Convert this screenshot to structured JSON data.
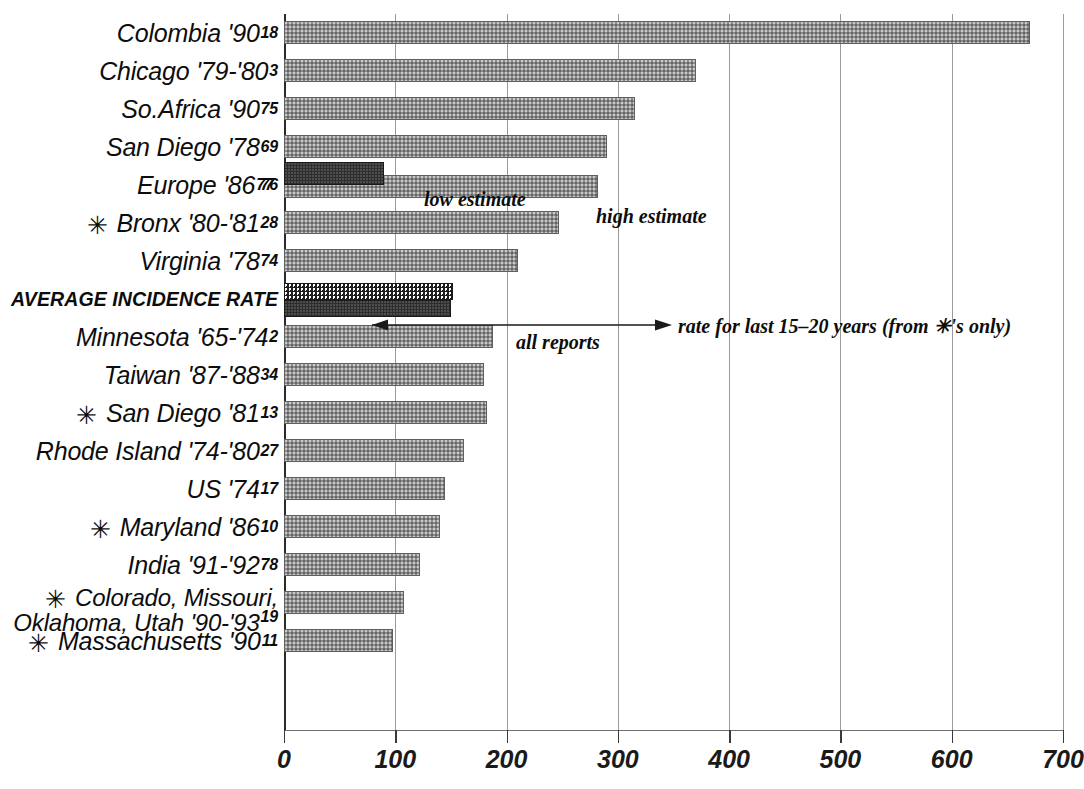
{
  "chart_data": {
    "type": "bar",
    "orientation": "horizontal",
    "title": "",
    "xlabel": "",
    "ylabel": "",
    "xlim": [
      0,
      700
    ],
    "xticks": [
      0,
      100,
      200,
      300,
      400,
      500,
      600,
      700
    ],
    "grid": true,
    "legend_position": "inline-annotations",
    "categories": [
      "Colombia '90",
      "Chicago '79-'80",
      "So.Africa '90",
      "San Diego '78",
      "Europe '86",
      "Bronx '80-'81",
      "Virginia '78",
      "AVERAGE INCIDENCE RATE",
      "Minnesota '65-'74",
      "Taiwan '87-'88",
      "San Diego '81",
      "Rhode Island '74-'80",
      "US '74",
      "Maryland '86",
      "India '91-'92",
      "Colorado, Missouri, Oklahoma, Utah '90-'93",
      "Massachusetts '90"
    ],
    "values": [
      670,
      370,
      315,
      290,
      282,
      247,
      210,
      152,
      188,
      180,
      182,
      162,
      145,
      140,
      122,
      108,
      98
    ],
    "secondary_values": [
      null,
      null,
      null,
      null,
      90,
      null,
      null,
      150,
      null,
      null,
      null,
      null,
      null,
      null,
      null,
      null,
      null
    ],
    "rows": [
      {
        "label": "Colombia '90",
        "refs_sup": "18",
        "refs_sub": "",
        "starred": false,
        "value": 670,
        "style": "gray"
      },
      {
        "label": "Chicago '79-'80",
        "refs_sup": "3",
        "refs_sub": "",
        "starred": false,
        "value": 370,
        "style": "gray"
      },
      {
        "label": "So.Africa '90",
        "refs_sup": "75",
        "refs_sub": "",
        "starred": false,
        "value": 315,
        "style": "gray"
      },
      {
        "label": "San Diego '78",
        "refs_sup": "69",
        "refs_sub": "",
        "starred": false,
        "value": 290,
        "style": "gray"
      },
      {
        "label": "Europe '86",
        "refs_sup": "77",
        "refs_sub": "76",
        "starred": false,
        "value": 282,
        "style": "gray",
        "overlay_value": 90,
        "overlay_style": "dark"
      },
      {
        "label": "Bronx '80-'81",
        "refs_sup": "28",
        "refs_sub": "",
        "starred": true,
        "value": 247,
        "style": "gray"
      },
      {
        "label": "Virginia '78",
        "refs_sup": "74",
        "refs_sub": "",
        "starred": false,
        "value": 210,
        "style": "gray"
      },
      {
        "label": "AVERAGE INCIDENCE RATE",
        "refs_sup": "",
        "refs_sub": "",
        "starred": false,
        "value": 152,
        "style": "hatch",
        "overlay_value": 150,
        "overlay_style": "dark"
      },
      {
        "label": "Minnesota '65-'74",
        "refs_sup": "2",
        "refs_sub": "",
        "starred": false,
        "value": 188,
        "style": "gray"
      },
      {
        "label": "Taiwan '87-'88",
        "refs_sup": "34",
        "refs_sub": "",
        "starred": false,
        "value": 180,
        "style": "gray"
      },
      {
        "label": "San Diego '81",
        "refs_sup": "13",
        "refs_sub": "",
        "starred": true,
        "value": 182,
        "style": "gray"
      },
      {
        "label": "Rhode Island '74-'80",
        "refs_sup": "27",
        "refs_sub": "",
        "starred": false,
        "value": 162,
        "style": "gray"
      },
      {
        "label": "US '74",
        "refs_sup": "17",
        "refs_sub": "",
        "starred": false,
        "value": 145,
        "style": "gray"
      },
      {
        "label": "Maryland '86",
        "refs_sup": "10",
        "refs_sub": "",
        "starred": true,
        "value": 140,
        "style": "gray"
      },
      {
        "label": "India '91-'92",
        "refs_sup": "78",
        "refs_sub": "",
        "starred": false,
        "value": 122,
        "style": "gray"
      },
      {
        "label": "Colorado, Missouri, Oklahoma, Utah '90-'93",
        "label_line1": "Colorado, Missouri,",
        "label_line2": "Oklahoma, Utah '90-'93",
        "refs_sup": "19",
        "refs_sub": "",
        "starred": true,
        "value": 108,
        "style": "gray"
      },
      {
        "label": "Massachusetts '90",
        "refs_sup": "11",
        "refs_sub": "",
        "starred": true,
        "value": 98,
        "style": "gray"
      }
    ],
    "annotations": [
      {
        "id": "low-estimate",
        "text": "low estimate"
      },
      {
        "id": "high-estimate",
        "text": "high estimate"
      },
      {
        "id": "all-reports",
        "text": "all reports"
      },
      {
        "id": "rate-last-years",
        "text": "rate for last 15–20 years (from ✳'s only)"
      }
    ]
  },
  "axis": {
    "tick_labels": [
      "0",
      "100",
      "200",
      "300",
      "400",
      "500",
      "600",
      "700"
    ]
  },
  "colors": {
    "bar_gray": "#8d8d8d",
    "bar_dark": "#2e2e2e",
    "hatch": "#1d1d1d",
    "gridline": "#9a9a9a",
    "text": "#0d0d0d"
  }
}
